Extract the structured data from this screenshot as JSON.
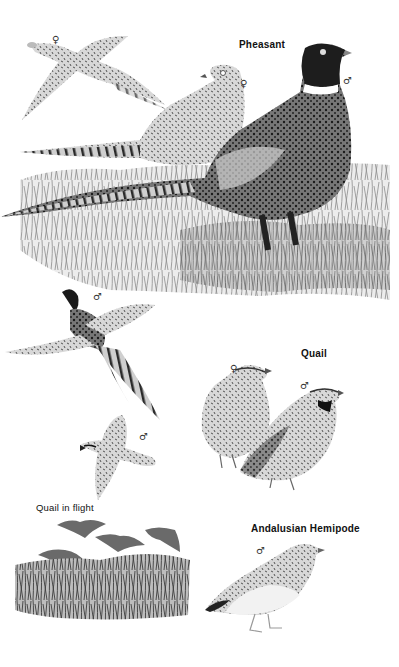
{
  "plate": {
    "background": "#ffffff",
    "ink": "#111111"
  },
  "labels": {
    "pheasant": "Pheasant",
    "quail": "Quail",
    "quail_in_flight": "Quail in flight",
    "andalusian_hemipode": "Andalusian Hemipode"
  },
  "sex_symbols": {
    "female_flying_pheasant": "♀",
    "female_pheasant": "♀",
    "male_pheasant": "♂",
    "male_flying_pheasant": "♂",
    "female_quail": "♀",
    "male_quail": "♂",
    "male_flying_quail": "♂",
    "male_hemipode": "♂"
  },
  "illustrations": [
    {
      "id": "pheasant-female-flight",
      "description": "Female pheasant in flight"
    },
    {
      "id": "pheasant-female-standing",
      "description": "Female pheasant standing in grass"
    },
    {
      "id": "pheasant-male-standing",
      "description": "Male pheasant with dark head and white neck ring, long barred tail"
    },
    {
      "id": "pheasant-male-flight",
      "description": "Male pheasant in flight"
    },
    {
      "id": "quail-female",
      "description": "Female quail standing"
    },
    {
      "id": "quail-male",
      "description": "Male quail standing"
    },
    {
      "id": "quail-male-flight",
      "description": "Male quail in flight"
    },
    {
      "id": "quail-flock-flight",
      "description": "Four quail flying over grass"
    },
    {
      "id": "hemipode-male",
      "description": "Male Andalusian Hemipode standing"
    }
  ]
}
